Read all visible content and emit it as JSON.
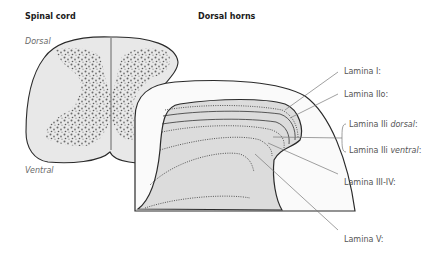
{
  "titles": {
    "left": "Spinal cord",
    "right": "Dorsal horns"
  },
  "orientation": {
    "top": "Dorsal",
    "bottom": "Ventral"
  },
  "labels": [
    {
      "id": "lamina-i",
      "text": "Lamina I:"
    },
    {
      "id": "lamina-iio",
      "text": "Lamina IIo:"
    },
    {
      "id": "lamina-iii-dorsal",
      "prefix": "Lamina IIi ",
      "italic": "dorsal",
      "suffix": ":"
    },
    {
      "id": "lamina-iii-ventral",
      "prefix": "Lamina IIi ",
      "italic": "ventral",
      "suffix": ":"
    },
    {
      "id": "lamina-iii-iv",
      "text": "Lamina III-IV:"
    },
    {
      "id": "lamina-v",
      "text": "Lamina V:"
    }
  ],
  "colors": {
    "tissue_fill": "#e6e6e6",
    "inner_fill": "#d9d9d9",
    "outline": "#2a2a2a",
    "leader": "#777777",
    "grey_matter_dots": "#555555"
  }
}
